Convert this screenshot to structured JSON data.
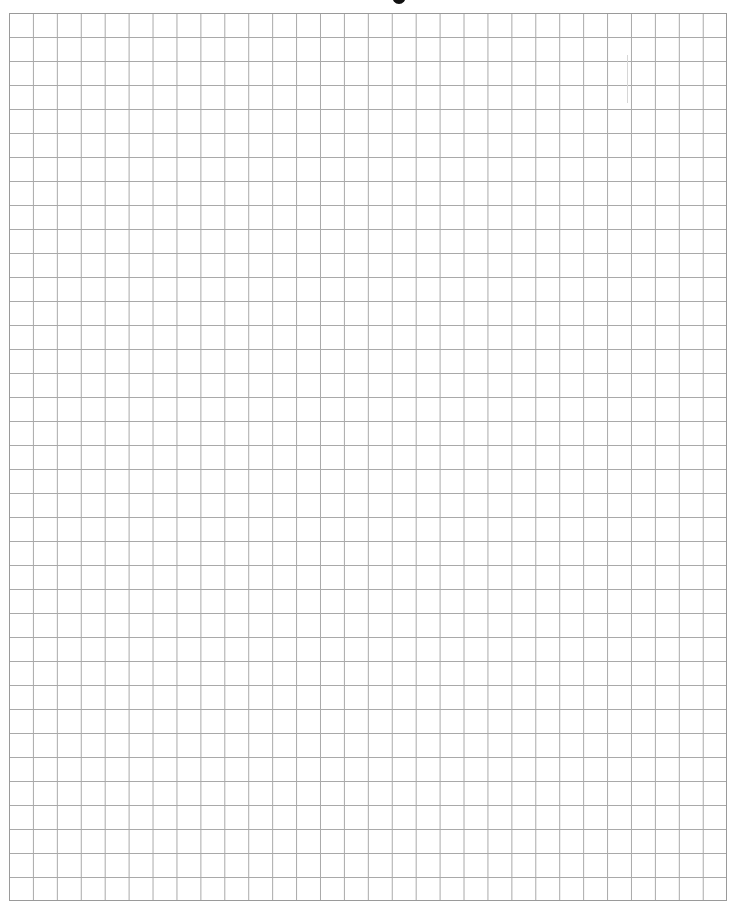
{
  "page": {
    "type": "graph-paper",
    "title_fragment": "",
    "grid": {
      "columns": 30,
      "rows": 37,
      "cell_size_px": 24,
      "line_color": "#a9a9a9",
      "border_color": "#9a9a9a",
      "background_color": "#ffffff"
    }
  }
}
